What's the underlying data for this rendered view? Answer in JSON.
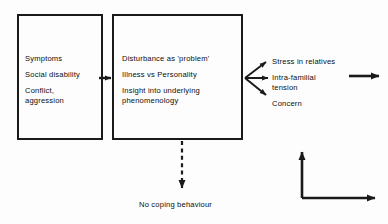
{
  "diagram": {
    "boxes": [
      {
        "id": "box-one",
        "name": "patient-factors-box",
        "lines": [
          "Symptoms",
          "Social disability",
          "Conflict,",
          "aggression"
        ]
      },
      {
        "id": "box-two",
        "name": "appraisal-box",
        "lines": [
          "Disturbance as 'problem'",
          "Illness vs Personality",
          "Insight into underlying",
          "phenomenology"
        ]
      }
    ],
    "outcomes": [
      {
        "name": "outcome-stress-in-relatives",
        "lines": [
          "Stress in relatives"
        ]
      },
      {
        "name": "outcome-intra-familial-tension",
        "lines": [
          "Intra-familial",
          "tension"
        ]
      },
      {
        "name": "outcome-concern",
        "lines": [
          "Concern"
        ]
      }
    ],
    "bottom_label": "No coping behaviour",
    "connectors": [
      {
        "name": "box-one-to-box-two-arrow",
        "style": "solid",
        "direction": "right"
      },
      {
        "name": "fan-arrow-upper",
        "style": "solid",
        "direction": "up-right"
      },
      {
        "name": "fan-arrow-middle",
        "style": "solid",
        "direction": "right"
      },
      {
        "name": "fan-arrow-lower",
        "style": "solid",
        "direction": "down-right"
      },
      {
        "name": "outgoing-arrow-right",
        "style": "solid",
        "direction": "right"
      },
      {
        "name": "no-coping-dashed-arrow",
        "style": "dashed",
        "direction": "down"
      },
      {
        "name": "feedback-elbow-arrow",
        "style": "solid",
        "direction": "up-and-right"
      }
    ],
    "colors": {
      "stroke": "#1a1a1a",
      "text": "#0d0d0d",
      "background": "#fdfdfd"
    }
  }
}
